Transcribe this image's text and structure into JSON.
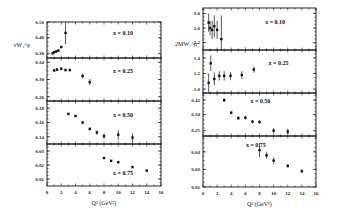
{
  "chart_data": [
    {
      "type": "scatter",
      "ylabel": "νW₂^p",
      "xlabel": "Q² (GeV²)",
      "xlim": [
        0,
        16
      ],
      "xticks": [
        "0",
        "2",
        "4",
        "6",
        "8",
        "10",
        "12",
        "14",
        "16"
      ],
      "panels": [
        {
          "label": "x = 0.10",
          "ylim": [
            0.27,
            0.5
          ],
          "yticks": [
            {
              "v": 0.3,
              "t": "0.30"
            },
            {
              "v": 0.4,
              "t": "0.40"
            },
            {
              "v": 0.5,
              "t": "0.50"
            }
          ],
          "points": [
            {
              "x": 0.8,
              "y": 0.3,
              "e": 0.006
            },
            {
              "x": 1.0,
              "y": 0.308,
              "e": 0.006
            },
            {
              "x": 1.3,
              "y": 0.312,
              "e": 0.006
            },
            {
              "x": 1.6,
              "y": 0.318,
              "e": 0.007
            },
            {
              "x": 2.0,
              "y": 0.34,
              "e": 0.008
            },
            {
              "x": 2.6,
              "y": 0.43,
              "e": 0.07
            }
          ]
        },
        {
          "label": "x = 0.25",
          "ylim": [
            0.25,
            0.35
          ],
          "yticks": [
            {
              "v": 0.26,
              "t": "0.26"
            },
            {
              "v": 0.3,
              "t": "0.30"
            },
            {
              "v": 0.34,
              "t": "0.34"
            }
          ],
          "points": [
            {
              "x": 1.0,
              "y": 0.321,
              "e": 0.003
            },
            {
              "x": 1.4,
              "y": 0.323,
              "e": 0.003
            },
            {
              "x": 2.0,
              "y": 0.325,
              "e": 0.003
            },
            {
              "x": 2.6,
              "y": 0.322,
              "e": 0.003
            },
            {
              "x": 3.2,
              "y": 0.322,
              "e": 0.003
            },
            {
              "x": 5.0,
              "y": 0.308,
              "e": 0.006
            },
            {
              "x": 6.0,
              "y": 0.294,
              "e": 0.007
            }
          ]
        },
        {
          "label": "x = 0.50",
          "ylim": [
            0.13,
            0.19
          ],
          "yticks": [
            {
              "v": 0.14,
              "t": "0.14"
            },
            {
              "v": 0.16,
              "t": "0.16"
            },
            {
              "v": 0.18,
              "t": "0.18"
            }
          ],
          "points": [
            {
              "x": 3,
              "y": 0.172,
              "e": 0.001
            },
            {
              "x": 4,
              "y": 0.169,
              "e": 0.001
            },
            {
              "x": 5,
              "y": 0.16,
              "e": 0.002
            },
            {
              "x": 6,
              "y": 0.151,
              "e": 0.002
            },
            {
              "x": 7,
              "y": 0.146,
              "e": 0.003
            },
            {
              "x": 8,
              "y": 0.141,
              "e": 0.004
            },
            {
              "x": 10,
              "y": 0.143,
              "e": 0.007
            },
            {
              "x": 12,
              "y": 0.139,
              "e": 0.006
            }
          ]
        },
        {
          "label": "x = 0.75",
          "ylim": [
            0.005,
            0.035
          ],
          "yticks": [
            {
              "v": 0.01,
              "t": "0.01"
            },
            {
              "v": 0.02,
              "t": "0.02"
            },
            {
              "v": 0.03,
              "t": "0.03"
            }
          ],
          "points": [
            {
              "x": 8,
              "y": 0.025,
              "e": 0.0005
            },
            {
              "x": 9,
              "y": 0.023,
              "e": 0.0005
            },
            {
              "x": 10,
              "y": 0.022,
              "e": 0.0005
            },
            {
              "x": 12,
              "y": 0.0185,
              "e": 0.0005
            },
            {
              "x": 14,
              "y": 0.016,
              "e": 0.0005
            }
          ]
        }
      ]
    },
    {
      "type": "scatter",
      "ylabel": "2MW₁^p",
      "xlabel": "Q² (GeV²)",
      "xlim": [
        0,
        16
      ],
      "xticks": [
        "0",
        "2",
        "4",
        "6",
        "8",
        "10",
        "12",
        "14",
        "16"
      ],
      "panels": [
        {
          "label": "x = 0.10",
          "ylim": [
            2.0,
            3.15
          ],
          "yticks": [
            {
              "v": 2.2,
              "t": "2.2"
            },
            {
              "v": 2.6,
              "t": "2.6"
            },
            {
              "v": 3.0,
              "t": "3.0"
            }
          ],
          "points": [
            {
              "x": 0.8,
              "y": 2.75,
              "e": 0.25
            },
            {
              "x": 1.0,
              "y": 2.6,
              "e": 0.2
            },
            {
              "x": 1.3,
              "y": 2.55,
              "e": 0.25
            },
            {
              "x": 1.6,
              "y": 2.65,
              "e": 0.3
            },
            {
              "x": 2.0,
              "y": 2.55,
              "e": 0.25
            },
            {
              "x": 2.6,
              "y": 2.3,
              "e": 0.65
            }
          ]
        },
        {
          "label": "x = 0.25",
          "ylim": [
            0.95,
            1.5
          ],
          "yticks": [
            {
              "v": 1.0,
              "t": "1.0"
            },
            {
              "v": 1.2,
              "t": "1.2"
            },
            {
              "v": 1.4,
              "t": "1.4"
            }
          ],
          "points": [
            {
              "x": 0.8,
              "y": 1.08,
              "e": 0.12
            },
            {
              "x": 1.1,
              "y": 1.33,
              "e": 0.1
            },
            {
              "x": 1.6,
              "y": 1.13,
              "e": 0.08
            },
            {
              "x": 2.3,
              "y": 1.17,
              "e": 0.06
            },
            {
              "x": 3.0,
              "y": 1.17,
              "e": 0.06
            },
            {
              "x": 3.9,
              "y": 1.17,
              "e": 0.05
            },
            {
              "x": 5.5,
              "y": 1.18,
              "e": 0.05
            },
            {
              "x": 7.2,
              "y": 1.25,
              "e": 0.04
            }
          ]
        },
        {
          "label": "x = 0.50",
          "ylim": [
            0.22,
            0.46
          ],
          "yticks": [
            {
              "v": 0.25,
              "t": "0.25"
            },
            {
              "v": 0.34,
              "t": "0.34"
            },
            {
              "v": 0.42,
              "t": "0.42"
            }
          ],
          "points": [
            {
              "x": 3,
              "y": 0.42,
              "e": 0.01
            },
            {
              "x": 4,
              "y": 0.35,
              "e": 0.008
            },
            {
              "x": 5,
              "y": 0.32,
              "e": 0.01
            },
            {
              "x": 6,
              "y": 0.322,
              "e": 0.01
            },
            {
              "x": 7,
              "y": 0.3,
              "e": 0.01
            },
            {
              "x": 8,
              "y": 0.298,
              "e": 0.01
            },
            {
              "x": 10,
              "y": 0.25,
              "e": 0.015
            },
            {
              "x": 12,
              "y": 0.245,
              "e": 0.015
            }
          ]
        },
        {
          "label": "x = 0.75",
          "ylim": [
            0.02,
            0.049
          ],
          "yticks": [
            {
              "v": 0.02,
              "t": "0.02"
            },
            {
              "v": 0.03,
              "t": "0.03"
            },
            {
              "v": 0.04,
              "t": "0.04"
            }
          ],
          "points": [
            {
              "x": 8,
              "y": 0.041,
              "e": 0.004
            },
            {
              "x": 9,
              "y": 0.038,
              "e": 0.002
            },
            {
              "x": 10,
              "y": 0.035,
              "e": 0.002
            },
            {
              "x": 12,
              "y": 0.032,
              "e": 0.001
            },
            {
              "x": 14,
              "y": 0.029,
              "e": 0.001
            }
          ]
        }
      ]
    }
  ]
}
